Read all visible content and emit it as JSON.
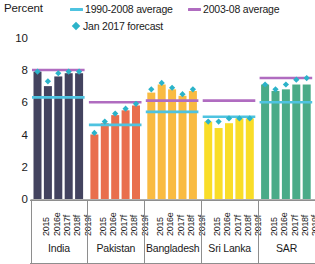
{
  "header": {
    "axis_title": "Percent"
  },
  "legend": {
    "items": [
      {
        "id": "avg1990",
        "label": "1990-2008 average",
        "marker": "line",
        "color": "#4ec3e0"
      },
      {
        "id": "avg2003",
        "label": "2003-08 average",
        "marker": "line",
        "color": "#b06cc0"
      },
      {
        "id": "forecast",
        "label": "Jan 2017 forecast",
        "marker": "diamond",
        "color": "#2bb3c9"
      }
    ]
  },
  "chart_data": {
    "type": "bar",
    "title": "Percent",
    "xlabel": "",
    "ylabel": "Percent",
    "ylim": [
      0,
      10
    ],
    "yticks": [
      0,
      2,
      4,
      6,
      8,
      10
    ],
    "grid": false,
    "legend_position": "top",
    "categories": [
      "2015",
      "2016e",
      "2017f",
      "2018f",
      "2019f"
    ],
    "groups": [
      {
        "name": "India",
        "color": "#43435f",
        "values": [
          7.9,
          7.0,
          7.6,
          7.8,
          7.8
        ],
        "avg_1990_2008": 6.3,
        "avg_2003_08": 8.0,
        "jan_2017_forecast": [
          7.9,
          7.3,
          7.8,
          7.9,
          7.9
        ]
      },
      {
        "name": "Pakistan",
        "color": "#e96f4d",
        "values": [
          4.0,
          4.7,
          5.2,
          5.5,
          5.8
        ],
        "avg_1990_2008": 4.6,
        "avg_2003_08": 6.0,
        "jan_2017_forecast": [
          4.1,
          4.8,
          5.3,
          5.6,
          5.9
        ]
      },
      {
        "name": "Bangladesh",
        "color": "#f9bb42",
        "values": [
          6.6,
          7.1,
          6.8,
          6.4,
          6.7
        ],
        "avg_1990_2008": 5.4,
        "avg_2003_08": 6.1,
        "jan_2017_forecast": [
          6.8,
          7.2,
          6.9,
          6.5,
          6.8
        ]
      },
      {
        "name": "Sri Lanka",
        "color": "#f9dd28",
        "values": [
          4.8,
          4.4,
          4.7,
          5.0,
          5.0
        ],
        "avg_1990_2008": 5.1,
        "avg_2003_08": 6.1,
        "jan_2017_forecast": [
          4.8,
          4.8,
          5.0,
          5.0,
          5.0
        ]
      },
      {
        "name": "SAR",
        "color": "#4aab88",
        "values": [
          7.1,
          6.7,
          6.8,
          7.1,
          7.1
        ],
        "avg_1990_2008": 6.0,
        "avg_2003_08": 7.5,
        "jan_2017_forecast": [
          7.1,
          6.8,
          7.1,
          7.4,
          7.5
        ]
      }
    ]
  }
}
